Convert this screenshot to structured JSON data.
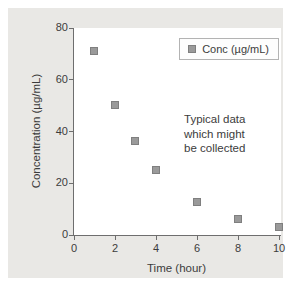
{
  "figure": {
    "panel_bg": "#e9e8e5",
    "plot_bg": "#ffffff",
    "axis_color": "#6e6e6e",
    "text_color": "#3c3c3c",
    "marker_fill": "#9a9a9a",
    "marker_border": "#7f7f7f",
    "legend_border": "#b3b3b3"
  },
  "chart_data": {
    "type": "scatter",
    "series": [
      {
        "name": "Conc (µg/mL)",
        "x": [
          1,
          2,
          3,
          4,
          6,
          8,
          10
        ],
        "y": [
          71,
          50,
          36,
          25,
          12.5,
          6,
          3
        ]
      }
    ],
    "title": "",
    "xlabel": "Time (hour)",
    "ylabel": "Concentration (µg/mL)",
    "xlim": [
      0,
      10
    ],
    "ylim": [
      0,
      80
    ],
    "x_ticks": [
      0,
      2,
      4,
      6,
      8,
      10
    ],
    "y_ticks": [
      0,
      20,
      40,
      60,
      80
    ],
    "grid": false,
    "legend_position": "top-right",
    "marker": "square",
    "annotation": "Typical data\nwhich might\nbe collected"
  }
}
